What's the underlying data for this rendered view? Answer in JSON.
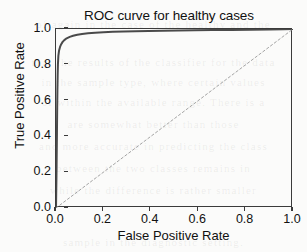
{
  "figure": {
    "background_color": "#fbfbfa",
    "frame_color": "#3b3b3b",
    "text_color": "#111111"
  },
  "ghost_text": {
    "note": "faint bleed-through text from reverse side of scanned page",
    "lines": [
      "of  again  in  the  case  of  the  healthy  and  the",
      "that  the  results  of  the  classifier  for  the  data",
      "in  the  sample  type,  where  certain  values",
      "of  within  the  available  range.  There  is  a",
      "are  somewhat  better  than  those",
      "and  more  accurate  in  predicting  the  class",
      "between  the  two  classes  remains  in",
      "while  the  difference  is  rather  smaller",
      "sample  in  the  diagnostic  setting."
    ]
  },
  "chart_data": {
    "type": "line",
    "title": "ROC curve for healthy cases",
    "xlabel": "False Positive Rate",
    "ylabel": "True Positive Rate",
    "xlim": [
      0.0,
      1.0
    ],
    "ylim": [
      0.0,
      1.0
    ],
    "grid": false,
    "legend": null,
    "x_ticks": [
      0.0,
      0.2,
      0.4,
      0.6,
      0.8,
      1.0
    ],
    "x_tick_labels": [
      "0.0",
      "0.2",
      "0.4",
      "0.6",
      "0.8",
      "1.0"
    ],
    "y_ticks": [
      0.0,
      0.2,
      0.4,
      0.6,
      0.8,
      1.0
    ],
    "y_tick_labels": [
      "0.0",
      "0.2",
      "0.4",
      "0.6",
      "0.8",
      "1.0"
    ],
    "series": [
      {
        "name": "ROC curve",
        "style": "solid",
        "color": "#4a4a4a",
        "width": 2.0,
        "x": [
          0.0,
          0.002,
          0.004,
          0.005,
          0.006,
          0.007,
          0.008,
          0.01,
          0.013,
          0.017,
          0.022,
          0.028,
          0.035,
          0.045,
          0.058,
          0.072,
          0.09,
          0.11,
          0.135,
          0.165,
          0.2,
          0.24,
          0.285,
          0.335,
          0.39,
          0.45,
          0.515,
          0.585,
          0.66,
          0.74,
          0.82,
          0.9,
          0.96,
          1.0
        ],
        "y": [
          0.0,
          0.18,
          0.42,
          0.56,
          0.66,
          0.74,
          0.8,
          0.85,
          0.88,
          0.9,
          0.915,
          0.928,
          0.938,
          0.948,
          0.956,
          0.962,
          0.968,
          0.972,
          0.976,
          0.979,
          0.982,
          0.984,
          0.986,
          0.988,
          0.989,
          0.99,
          0.992,
          0.993,
          0.994,
          0.995,
          0.996,
          0.997,
          0.999,
          1.0
        ]
      },
      {
        "name": "chance diagonal",
        "style": "dashed",
        "color": "#9a9a9a",
        "width": 0.9,
        "x": [
          0.0,
          1.0
        ],
        "y": [
          0.0,
          1.0
        ]
      }
    ]
  }
}
